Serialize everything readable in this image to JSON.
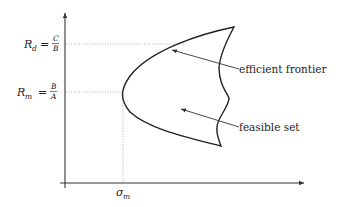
{
  "diagram": {
    "axes": {
      "x_label": "",
      "y_label": ""
    },
    "markers": {
      "r_d": {
        "symbol": "R",
        "subscript": "d",
        "equals": "=",
        "numerator": "C",
        "denominator": "B"
      },
      "r_m": {
        "symbol": "R",
        "subscript": "m",
        "equals": "=",
        "numerator": "B",
        "denominator": "A"
      },
      "sigma_m": {
        "symbol": "σ",
        "subscript": "m"
      }
    },
    "annotations": {
      "efficient_frontier": "efficient frontier",
      "feasible_set": "feasible set"
    },
    "colors": {
      "curve": "#222222",
      "guide": "#9a9a9a",
      "axis": "#333333"
    }
  }
}
